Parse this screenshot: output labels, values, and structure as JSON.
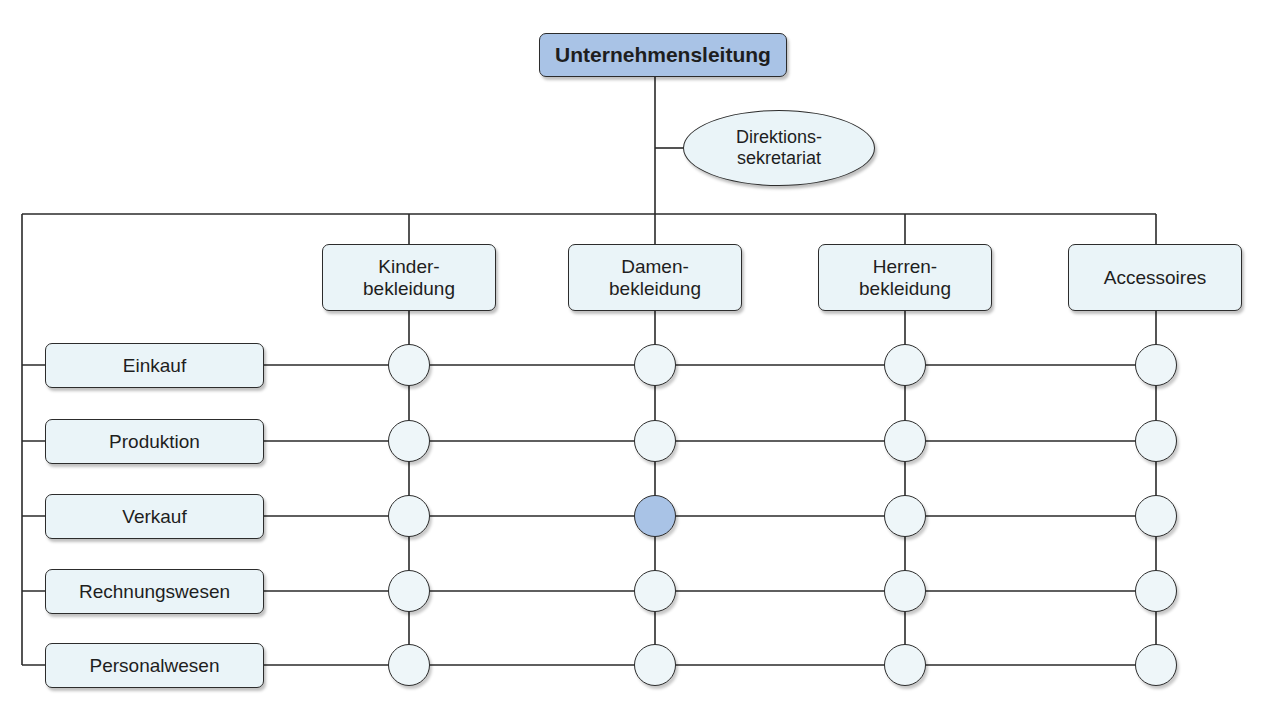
{
  "top": {
    "label": "Unternehmensleitung",
    "fill": "#a9c3e6"
  },
  "staff": {
    "label": "Direktions-\nsekretariat"
  },
  "columns": [
    {
      "label": "Kinder-\nbekleidung",
      "x": 409
    },
    {
      "label": "Damen-\nbekleidung",
      "x": 655
    },
    {
      "label": "Herren-\nbekleidung",
      "x": 905
    },
    {
      "label": "Accessoires",
      "x": 1156
    }
  ],
  "rows": [
    {
      "label": "Einkauf",
      "y": 365
    },
    {
      "label": "Produktion",
      "y": 441
    },
    {
      "label": "Verkauf",
      "y": 516
    },
    {
      "label": "Rechnungswesen",
      "y": 591
    },
    {
      "label": "Personalwesen",
      "y": 665
    }
  ],
  "highlight": {
    "row": "Verkauf",
    "column": "Damen-\nbekleidung",
    "fill": "#a9c3e6"
  },
  "colors": {
    "box_fill": "#eaf4f8",
    "node_fill": "#eef6f9",
    "line": "#2a2a2a"
  }
}
